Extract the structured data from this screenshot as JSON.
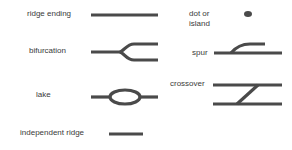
{
  "diagram": {
    "features": [
      {
        "id": "ridge-ending",
        "label": "ridge ending"
      },
      {
        "id": "dot-or-island",
        "label_line1": "dot or",
        "label_line2": "island"
      },
      {
        "id": "bifurcation",
        "label": "bifurcation"
      },
      {
        "id": "spur",
        "label": "spur"
      },
      {
        "id": "lake",
        "label": "lake"
      },
      {
        "id": "crossover",
        "label": "crossover"
      },
      {
        "id": "independent-ridge",
        "label": "independent ridge"
      }
    ],
    "colors": {
      "ridge": "#4a4a4a",
      "text": "#3a3a3a",
      "background": "#ffffff"
    }
  }
}
